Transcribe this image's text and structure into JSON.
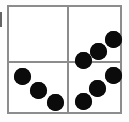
{
  "figure": {
    "background_color": "#ffffff",
    "line_color": "#8c8c8c",
    "dot_color": "#0b0b0b",
    "dot_diameter_px": 17,
    "box": {
      "left": 7,
      "top": 5,
      "width": 115,
      "height": 109
    },
    "artifact_label": "left-edge-scan-artifact"
  },
  "quadrants": [
    {
      "id": "top-left",
      "label": "Top left quadrant",
      "dot_count": 0,
      "arrangement": "empty",
      "dots": []
    },
    {
      "id": "top-right",
      "label": "Top right quadrant",
      "dot_count": 3,
      "arrangement": "diagonal ascending to the right",
      "dots": [
        {
          "cx": 44,
          "cy": 32
        },
        {
          "cx": 29,
          "cy": 44
        },
        {
          "cx": 14,
          "cy": 53
        }
      ]
    },
    {
      "id": "bottom-left",
      "label": "Bottom left quadrant",
      "dot_count": 3,
      "arrangement": "diagonal descending to the right",
      "dots": [
        {
          "cx": 13,
          "cy": 13
        },
        {
          "cx": 29,
          "cy": 27
        },
        {
          "cx": 46,
          "cy": 39
        }
      ]
    },
    {
      "id": "bottom-right",
      "label": "Bottom right quadrant",
      "dot_count": 3,
      "arrangement": "diagonal ascending to the right",
      "dots": [
        {
          "cx": 44,
          "cy": 12
        },
        {
          "cx": 28,
          "cy": 25
        },
        {
          "cx": 14,
          "cy": 38
        }
      ]
    }
  ],
  "totals": {
    "total_dots": 9
  }
}
